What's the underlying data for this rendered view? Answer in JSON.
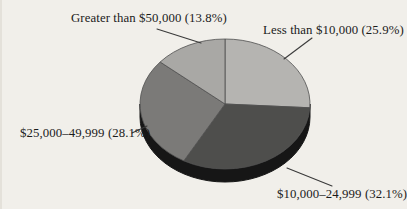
{
  "chart_data": {
    "type": "pie",
    "title": "",
    "categories": [
      "Less than $10,000",
      "$10,000–24,999",
      "$25,000–49,999",
      "Greater than $50,000"
    ],
    "values": [
      25.9,
      32.1,
      28.1,
      13.8
    ],
    "unit": "%",
    "slices": [
      {
        "label": "Less than $10,000",
        "value": 25.9,
        "display": "Less than $10,000 (25.9%)",
        "color": "#b5b4b1"
      },
      {
        "label": "$10,000–24,999",
        "value": 32.1,
        "display": "$10,000–24,999 (32.1%)",
        "color": "#4e4e4c"
      },
      {
        "label": "$25,000–49,999",
        "value": 28.1,
        "display": "$25,000–49,999 (28.1%)",
        "color": "#7b7a78"
      },
      {
        "label": "Greater than $50,000",
        "value": 13.8,
        "display": "Greater than $50,000 (13.8%)",
        "color": "#a9a8a5"
      }
    ],
    "layout": {
      "start_angle": "12-o-clock",
      "direction": "clockwise",
      "effect": "3d",
      "legend": "callout-labels",
      "grid": "off"
    },
    "colors": {
      "depth": "#161616",
      "outline": "#4f4f4f",
      "leader_line": "#3a3a3a",
      "background": "#f1efea",
      "text": "#1b1b1b"
    }
  }
}
